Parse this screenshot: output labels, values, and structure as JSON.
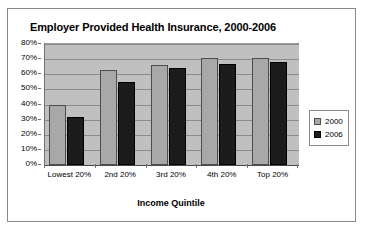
{
  "chart_data": {
    "type": "bar",
    "title": "Employer Provided Health Insurance, 2000-2006",
    "xlabel": "Income Quintile",
    "ylabel": "",
    "categories": [
      "Lowest 20%",
      "2nd 20%",
      "3rd 20%",
      "4th 20%",
      "Top 20%"
    ],
    "series": [
      {
        "name": "2000",
        "color": "#a8a8a8",
        "values": [
          40,
          63,
          66,
          71,
          71
        ]
      },
      {
        "name": "2006",
        "color": "#1c1c1c",
        "values": [
          32,
          55,
          64,
          67,
          68
        ]
      }
    ],
    "ylim": [
      0,
      80
    ],
    "ytick_labels": [
      "80%",
      "70%",
      "60%",
      "50%",
      "40%",
      "30%",
      "20%",
      "10%",
      "0%"
    ],
    "ytick_values": [
      80,
      70,
      60,
      50,
      40,
      30,
      20,
      10,
      0
    ],
    "grid": true,
    "legend_position": "right",
    "plot_background": "#c0c0c0"
  },
  "legend": {
    "entries": [
      {
        "label": "2000"
      },
      {
        "label": "2006"
      }
    ]
  }
}
